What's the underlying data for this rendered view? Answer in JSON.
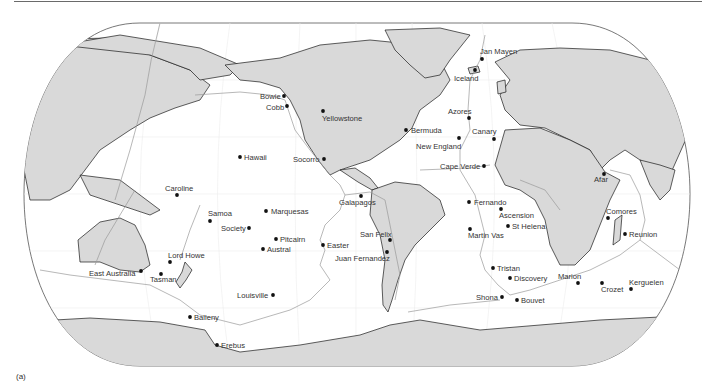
{
  "figure": {
    "caption": "(a)",
    "type": "world map of hotspot locations",
    "projection": "pseudo-cylindrical (Robinson-like), Pacific-centered",
    "colors": {
      "land": "#d9d9d9",
      "ocean": "#ffffff",
      "coast": "#1a1a1a",
      "plate_boundary": "#9a9a9a",
      "graticule": "#ececec",
      "dot": "#111111",
      "label": "#333333"
    }
  },
  "hotspots": [
    {
      "name": "Jan Mayen",
      "x": 482,
      "y": 59,
      "lx": 480,
      "ly": 54,
      "anchor": "start"
    },
    {
      "name": "Iceland",
      "x": 475,
      "y": 70,
      "lx": 454,
      "ly": 81,
      "anchor": "start"
    },
    {
      "name": "Bowie",
      "x": 284,
      "y": 96,
      "lx": 260,
      "ly": 99,
      "anchor": "start"
    },
    {
      "name": "Cobb",
      "x": 287,
      "y": 106,
      "lx": 266,
      "ly": 110,
      "anchor": "start"
    },
    {
      "name": "Yellowstone",
      "x": 323,
      "y": 111,
      "lx": 322,
      "ly": 121,
      "anchor": "start"
    },
    {
      "name": "Azores",
      "x": 469,
      "y": 118,
      "lx": 448,
      "ly": 114,
      "anchor": "start"
    },
    {
      "name": "Bermuda",
      "x": 406,
      "y": 130,
      "lx": 411,
      "ly": 133,
      "anchor": "start"
    },
    {
      "name": "Canary",
      "x": 494,
      "y": 139,
      "lx": 472,
      "ly": 134,
      "anchor": "start"
    },
    {
      "name": "New England",
      "x": 459,
      "y": 138,
      "lx": 416,
      "ly": 149,
      "anchor": "start"
    },
    {
      "name": "Hawaii",
      "x": 240,
      "y": 157,
      "lx": 244,
      "ly": 160,
      "anchor": "start"
    },
    {
      "name": "Socorro",
      "x": 324,
      "y": 159,
      "lx": 293,
      "ly": 162,
      "anchor": "start"
    },
    {
      "name": "Cape Verde",
      "x": 484,
      "y": 166,
      "lx": 440,
      "ly": 169,
      "anchor": "start"
    },
    {
      "name": "Afar",
      "x": 604,
      "y": 174,
      "lx": 594,
      "ly": 182,
      "anchor": "start"
    },
    {
      "name": "Caroline",
      "x": 177,
      "y": 195,
      "lx": 165,
      "ly": 191,
      "anchor": "start"
    },
    {
      "name": "Galapagos",
      "x": 361,
      "y": 196,
      "lx": 339,
      "ly": 205,
      "anchor": "start"
    },
    {
      "name": "Fernando",
      "x": 469,
      "y": 202,
      "lx": 474,
      "ly": 205,
      "anchor": "start"
    },
    {
      "name": "Marquesas",
      "x": 266,
      "y": 211,
      "lx": 271,
      "ly": 214,
      "anchor": "start"
    },
    {
      "name": "Samoa",
      "x": 210,
      "y": 221,
      "lx": 208,
      "ly": 216,
      "anchor": "start"
    },
    {
      "name": "Ascension",
      "x": 501,
      "y": 209,
      "lx": 499,
      "ly": 218,
      "anchor": "start"
    },
    {
      "name": "Comores",
      "x": 608,
      "y": 218,
      "lx": 606,
      "ly": 214,
      "anchor": "start"
    },
    {
      "name": "Society",
      "x": 249,
      "y": 228,
      "lx": 221,
      "ly": 231,
      "anchor": "start"
    },
    {
      "name": "St Helena",
      "x": 508,
      "y": 226,
      "lx": 512,
      "ly": 229,
      "anchor": "start"
    },
    {
      "name": "Martin Vas",
      "x": 470,
      "y": 229,
      "lx": 468,
      "ly": 238,
      "anchor": "start"
    },
    {
      "name": "Reunion",
      "x": 625,
      "y": 234,
      "lx": 629,
      "ly": 237,
      "anchor": "start"
    },
    {
      "name": "San Felix",
      "x": 390,
      "y": 240,
      "lx": 360,
      "ly": 237,
      "anchor": "start"
    },
    {
      "name": "Pitcairn",
      "x": 276,
      "y": 239,
      "lx": 280,
      "ly": 242,
      "anchor": "start"
    },
    {
      "name": "Easter",
      "x": 323,
      "y": 245,
      "lx": 327,
      "ly": 248,
      "anchor": "start"
    },
    {
      "name": "Austral",
      "x": 263,
      "y": 249,
      "lx": 267,
      "ly": 252,
      "anchor": "start"
    },
    {
      "name": "Juan Fernandez",
      "x": 387,
      "y": 252,
      "lx": 335,
      "ly": 261,
      "anchor": "start"
    },
    {
      "name": "Lord Howe",
      "x": 170,
      "y": 262,
      "lx": 168,
      "ly": 258,
      "anchor": "start"
    },
    {
      "name": "East Australia",
      "x": 141,
      "y": 271,
      "lx": 89,
      "ly": 276,
      "anchor": "start"
    },
    {
      "name": "Tasman",
      "x": 161,
      "y": 274,
      "lx": 150,
      "ly": 282,
      "anchor": "start"
    },
    {
      "name": "Tristan",
      "x": 493,
      "y": 268,
      "lx": 497,
      "ly": 271,
      "anchor": "start"
    },
    {
      "name": "Discovery",
      "x": 510,
      "y": 278,
      "lx": 514,
      "ly": 281,
      "anchor": "start"
    },
    {
      "name": "Marion",
      "x": 578,
      "y": 283,
      "lx": 558,
      "ly": 279,
      "anchor": "start"
    },
    {
      "name": "Kerguelen",
      "x": 631,
      "y": 289,
      "lx": 629,
      "ly": 285,
      "anchor": "start"
    },
    {
      "name": "Crozet",
      "x": 602,
      "y": 283,
      "lx": 601,
      "ly": 292,
      "anchor": "start"
    },
    {
      "name": "Louisville",
      "x": 273,
      "y": 295,
      "lx": 237,
      "ly": 298,
      "anchor": "start"
    },
    {
      "name": "Shona",
      "x": 502,
      "y": 297,
      "lx": 476,
      "ly": 300,
      "anchor": "start"
    },
    {
      "name": "Bouvet",
      "x": 517,
      "y": 300,
      "lx": 521,
      "ly": 303,
      "anchor": "start"
    },
    {
      "name": "Balleny",
      "x": 190,
      "y": 317,
      "lx": 194,
      "ly": 320,
      "anchor": "start"
    },
    {
      "name": "Erebus",
      "x": 217,
      "y": 345,
      "lx": 221,
      "ly": 348,
      "anchor": "start"
    }
  ]
}
